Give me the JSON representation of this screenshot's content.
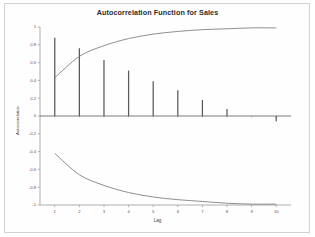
{
  "chart_data": {
    "type": "bar",
    "title": "Autocorrelation Function for Sales",
    "xlabel": "Lag",
    "ylabel": "Autocorrelation",
    "categories": [
      1,
      2,
      3,
      4,
      5,
      6,
      7,
      8,
      9,
      10
    ],
    "values": [
      0.88,
      0.76,
      0.63,
      0.51,
      0.39,
      0.29,
      0.18,
      0.08,
      0.0,
      -0.06
    ],
    "xlim": [
      0.4,
      10.6
    ],
    "ylim": [
      -1,
      1
    ],
    "xticks": [
      1,
      2,
      3,
      4,
      5,
      6,
      7,
      8,
      9,
      10
    ],
    "xtick_labels": [
      "1",
      "2",
      "3",
      "4",
      "5",
      "6",
      "7",
      "8",
      "9",
      "10"
    ],
    "yticks": [
      1,
      0.8,
      0.6,
      0.4,
      0.2,
      0,
      -0.2,
      -0.4,
      -0.6,
      -0.8,
      -1
    ],
    "ytick_labels": [
      "1",
      "0.8",
      "0.6",
      "0.4",
      "0.2",
      "0",
      "-0.2",
      "-0.4",
      "-0.6",
      "-0.8",
      "-1"
    ],
    "grid": false,
    "legend": null,
    "series": [
      {
        "name": "Autocorrelation",
        "type": "bar",
        "values": [
          0.88,
          0.76,
          0.63,
          0.51,
          0.39,
          0.29,
          0.18,
          0.08,
          0.0,
          -0.06
        ],
        "color": "#595959"
      },
      {
        "name": "Upper confidence limit",
        "type": "line",
        "x": [
          1,
          2,
          3,
          4,
          5,
          6,
          7,
          8,
          9,
          10
        ],
        "values": [
          0.43,
          0.67,
          0.79,
          0.87,
          0.92,
          0.95,
          0.97,
          0.98,
          0.99,
          0.99
        ],
        "color": "#7a7a7a"
      },
      {
        "name": "Lower confidence limit",
        "type": "line",
        "x": [
          1,
          2,
          3,
          4,
          5,
          6,
          7,
          8,
          9,
          10
        ],
        "values": [
          -0.42,
          -0.66,
          -0.78,
          -0.86,
          -0.91,
          -0.94,
          -0.96,
          -0.98,
          -0.99,
          -0.99
        ],
        "color": "#7a7a7a"
      }
    ]
  },
  "figure": {
    "title": "Autocorrelation Function for Sales",
    "axis_color": "#8c8c8c",
    "bar_color": "#595959",
    "curve_color": "#7a7a7a",
    "background": "#ffffff"
  }
}
